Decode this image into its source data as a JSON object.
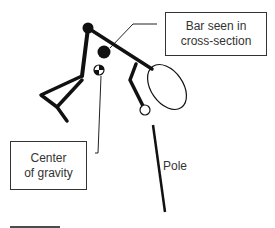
{
  "diagram": {
    "labels": {
      "bar": "Bar seen in cross-section",
      "bar_line1": "Bar seen in",
      "bar_line2": "cross-section",
      "cog": "Center of gravity",
      "cog_line1": "Center",
      "cog_line2": "of gravity",
      "pole": "Pole"
    },
    "colors": {
      "stroke": "#111111",
      "box_border": "#333333",
      "text": "#333333",
      "background": "#ffffff"
    },
    "elements": [
      {
        "name": "head",
        "shape": "filled-circle"
      },
      {
        "name": "bar-cross-section",
        "shape": "filled-circle"
      },
      {
        "name": "center-of-gravity",
        "shape": "quartered-circle"
      },
      {
        "name": "hand",
        "shape": "open-ellipse"
      },
      {
        "name": "foot",
        "shape": "open-circle"
      },
      {
        "name": "pole",
        "shape": "line"
      },
      {
        "name": "scale-bar",
        "shape": "line"
      }
    ]
  }
}
